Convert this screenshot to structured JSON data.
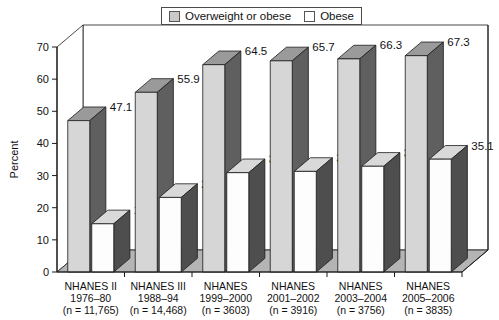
{
  "chart_data": {
    "type": "bar",
    "title": "",
    "xlabel": "",
    "ylabel": "Percent",
    "ylim": [
      0,
      70
    ],
    "yticks": [
      0,
      10,
      20,
      30,
      40,
      50,
      60,
      70
    ],
    "ytick_labels": [
      "0",
      "10",
      "20",
      "30",
      "40",
      "50",
      "60",
      "70"
    ],
    "grid": false,
    "legend_position": "top-center",
    "style": "3d-grouped-bar",
    "categories": [
      "NHANES II\n1976–80\n(n = 11,765)",
      "NHANES III\n1988–94\n(n = 14,468)",
      "NHANES\n1999–2000\n(n = 3603)",
      "NHANES\n2001–2002\n(n = 3916)",
      "NHANES\n2003–2004\n(n = 3756)",
      "NHANES\n2005–2006\n(n = 3835)"
    ],
    "series": [
      {
        "name": "Overweight or obese",
        "values": [
          47.1,
          55.9,
          64.5,
          65.7,
          66.3,
          67.3
        ],
        "value_labels": [
          "47.1",
          "55.9",
          "64.5",
          "65.7",
          "66.3",
          "67.3"
        ],
        "face_color": "#d6d6d6",
        "side_color": "#5f5f5f",
        "top_color": "#9a9a9a"
      },
      {
        "name": "Obese",
        "values": [
          15,
          23.2,
          30.9,
          31.3,
          32.9,
          35.1
        ],
        "value_labels": [
          "15",
          "23.2",
          "30.9",
          "31.3",
          "32.9",
          "35.1"
        ],
        "face_color": "#fdfdfd",
        "side_color": "#4e4e4e",
        "top_color": "#d9d9d9"
      }
    ]
  },
  "axis": {
    "ylabel": "Percent"
  },
  "legend": {
    "items": [
      {
        "label": "Overweight or obese",
        "swatch_color": "#c9c9c9"
      },
      {
        "label": "Obese",
        "swatch_color": "#ffffff"
      }
    ]
  },
  "categories_lines": [
    {
      "line1": "NHANES II",
      "line2": "1976–80",
      "line3": "(n = 11,765)"
    },
    {
      "line1": "NHANES III",
      "line2": "1988–94",
      "line3": "(n = 14,468)"
    },
    {
      "line1": "NHANES",
      "line2": "1999–2000",
      "line3": "(n = 3603)"
    },
    {
      "line1": "NHANES",
      "line2": "2001–2002",
      "line3": "(n = 3916)"
    },
    {
      "line1": "NHANES",
      "line2": "2003–2004",
      "line3": "(n = 3756)"
    },
    {
      "line1": "NHANES",
      "line2": "2005–2006",
      "line3": "(n = 3835)"
    }
  ],
  "colors": {
    "axis_line": "#1a1a1a",
    "floor": "#b4b4b4",
    "wall": "#ffffff",
    "text": "#111111"
  }
}
